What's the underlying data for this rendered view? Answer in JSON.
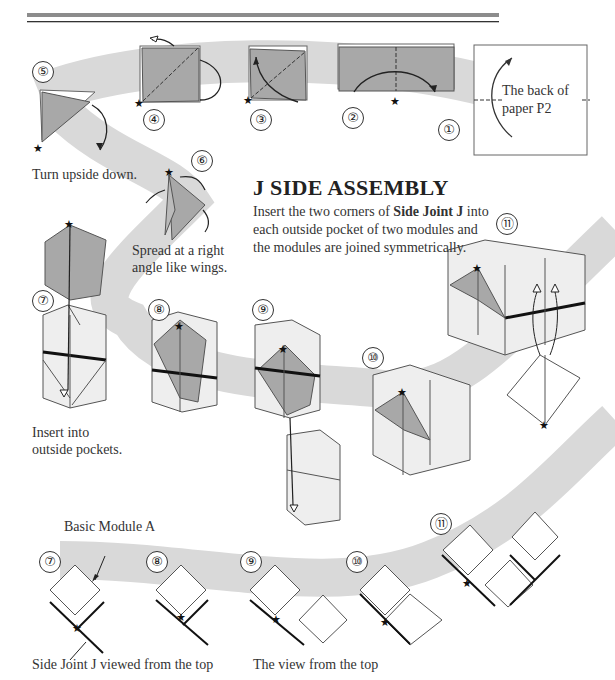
{
  "header": {
    "rule": "double-rule"
  },
  "section": {
    "title": "J SIDE ASSEMBLY",
    "intro_parts": [
      "Insert the two corners of ",
      "Side Joint J",
      " into each outside pocket of two modules and the modules are joined symmetrically."
    ]
  },
  "steps": {
    "s1": "①",
    "s2": "②",
    "s3": "③",
    "s4": "④",
    "s5": "⑤",
    "s6": "⑥",
    "s7": "⑦",
    "s8": "⑧",
    "s9": "⑨",
    "s10": "⑩",
    "s11": "⑪"
  },
  "captions": {
    "back_of_paper": "The back of paper P2",
    "back_line1": "The back of",
    "back_line2": "paper P2",
    "turn": "Turn upside down.",
    "spread_line1": "Spread at a right",
    "spread_line2": "angle like wings.",
    "insert_line1": "Insert into",
    "insert_line2": "outside pockets.",
    "basic_module": "Basic Module A",
    "side_joint_top": "Side Joint J viewed from the top",
    "view_top": "The view from the top"
  },
  "colors": {
    "band": "#d8d8d8",
    "paper_gray": "#a8a8a8",
    "module_face": "#eeeeee",
    "line": "#333333"
  }
}
